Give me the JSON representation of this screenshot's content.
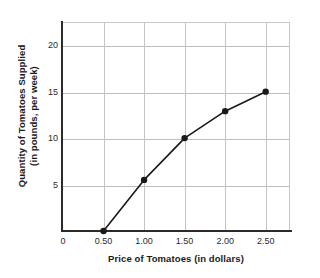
{
  "chart_data": {
    "type": "line",
    "title": "",
    "xlabel": "Price of Tomatoes (in dollars)",
    "ylabel_line1": "Quantity of Tomatoes Supplied",
    "ylabel_line2": "(in pounds, per week)",
    "x": [
      0.5,
      1.0,
      1.5,
      2.0,
      2.5
    ],
    "values": [
      0,
      5.5,
      10,
      12.9,
      15
    ],
    "series": [
      {
        "name": "Supply",
        "points": [
          {
            "x": 0.5,
            "y": 0
          },
          {
            "x": 1.0,
            "y": 5.5
          },
          {
            "x": 1.5,
            "y": 10
          },
          {
            "x": 2.0,
            "y": 12.9
          },
          {
            "x": 2.5,
            "y": 15
          }
        ]
      }
    ],
    "xlim": [
      0,
      2.8
    ],
    "ylim": [
      0,
      22.5
    ],
    "xticks": [
      0,
      0.5,
      1.0,
      1.5,
      2.0,
      2.5
    ],
    "xtick_labels": [
      "0",
      "0.50",
      "1.00",
      "1.50",
      "2.00",
      "2.50"
    ],
    "yticks": [
      5,
      10,
      15,
      20
    ],
    "ytick_labels": [
      "5",
      "10",
      "15",
      "20"
    ],
    "grid": true,
    "grid_axis": "both",
    "legend": false,
    "legend_position": "none",
    "marker": "filled-circle",
    "line_color": "#1a1a1a",
    "marker_color": "#1a1a1a",
    "grid_color": "#bdbdbd",
    "axis_color": "#2b2b2b",
    "background": "#ffffff"
  }
}
